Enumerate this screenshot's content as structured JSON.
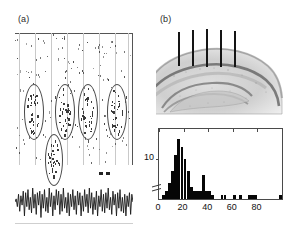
{
  "figure": {
    "background_color": "#ffffff"
  },
  "panel_a": {
    "label": "(a)",
    "name": "spike-raster-with-theta-trace",
    "description": "Raster of unit spikes across trials with grey vertical trial/position gridlines, five ellipse annotations marking clustered firing fields, a black scale marker, and a local-field-potential theta oscillation trace below.",
    "gridline_color": "#c9c9c9",
    "spike_color": "#3a3a3a",
    "ellipse_color": "#4a4a4a",
    "gridlines_x": [
      4,
      20,
      36,
      52,
      68,
      84,
      100,
      113
    ],
    "ellipses": [
      {
        "cx": 18,
        "cy": 78,
        "rx": 9,
        "ry": 27
      },
      {
        "cx": 49,
        "cy": 78,
        "rx": 9,
        "ry": 27
      },
      {
        "cx": 72,
        "cy": 78,
        "rx": 9,
        "ry": 27
      },
      {
        "cx": 101,
        "cy": 78,
        "rx": 9,
        "ry": 27
      },
      {
        "cx": 38,
        "cy": 126,
        "rx": 8,
        "ry": 25
      }
    ],
    "lfp_trace": {
      "name": "theta-oscillation",
      "color": "#1a1a1a",
      "points": [
        0,
        2,
        -3,
        5,
        -6,
        4,
        -2,
        7,
        -9,
        6,
        -3,
        8,
        -5,
        3,
        -7,
        9,
        -4,
        5,
        -8,
        6,
        -2,
        7,
        -10,
        5,
        -4,
        8,
        -6,
        3,
        -7,
        9,
        -3,
        6,
        -9,
        4,
        -5,
        8,
        -2,
        7,
        -8,
        5,
        -6,
        9,
        -4,
        3,
        -7,
        6,
        -9,
        5,
        -3,
        8,
        -5,
        4,
        -8,
        7,
        -2,
        6,
        -9,
        4,
        -6,
        8,
        -3,
        5,
        -7,
        9,
        -4,
        6,
        -8,
        3,
        -5,
        7,
        -9,
        4,
        -3,
        8,
        -6,
        5,
        -7,
        6,
        -4,
        9,
        -5,
        3,
        -8,
        7,
        -2,
        5,
        -9,
        6,
        -4,
        8,
        -6,
        3,
        -7,
        5,
        -9,
        4,
        -3,
        6,
        -8,
        5,
        0
      ]
    },
    "scale_marker": {
      "name": "scale-bar",
      "segments": 2
    }
  },
  "panel_b": {
    "label": "(b)",
    "name": "hippocampus-histology-section",
    "description": "Nissl-stained sagittal/coronal hippocampal section showing CA1 pyramidal layer, dentate gyrus and hilus, with five vertical tetrode/electrode tracks descending from the cortical surface.",
    "electrode_count": 5,
    "electrode_color": "#151515",
    "electrodes": [
      {
        "x": 22,
        "y": 4,
        "height": 34
      },
      {
        "x": 36,
        "y": 2,
        "height": 36
      },
      {
        "x": 50,
        "y": 1,
        "height": 38
      },
      {
        "x": 64,
        "y": 2,
        "height": 37
      },
      {
        "x": 78,
        "y": 3,
        "height": 36
      }
    ],
    "tissue_colors": {
      "background": "#ffffff",
      "light": "#e3e3e3",
      "mid": "#bdbdbd",
      "dark": "#8f8f8f",
      "cell_layer": "#6f6f6f"
    }
  },
  "panel_c": {
    "label": "(c)",
    "name": "firing-rate-histogram",
    "bar_color": "#060606",
    "axis_color": "#4a4a4a",
    "has_y_axis_break": true
  },
  "chart_data": {
    "type": "bar",
    "title": "",
    "subtitle": "",
    "xlabel": "",
    "ylabel": "",
    "legend": [],
    "grid": false,
    "legend_position": "none",
    "xlim": [
      0,
      100
    ],
    "ylim": [
      0,
      17
    ],
    "xticks": [
      0,
      20,
      40,
      60,
      80
    ],
    "xtick_labels": [
      "0",
      "20",
      "40",
      "60",
      "80"
    ],
    "yticks": [
      10
    ],
    "ytick_labels": [
      "10"
    ],
    "bin_width": 2.5,
    "categories": [
      "0",
      "2.5",
      "5",
      "7.5",
      "10",
      "12.5",
      "15",
      "17.5",
      "20",
      "22.5",
      "25",
      "27.5",
      "30",
      "32.5",
      "35",
      "37.5",
      "40",
      "42.5",
      "45",
      "47.5",
      "50",
      "52.5",
      "55",
      "57.5",
      "60",
      "62.5",
      "65",
      "67.5",
      "70",
      "72.5",
      "75",
      "77.5",
      "80",
      "82.5",
      "85",
      "87.5",
      "90",
      "92.5",
      "95",
      "97.5"
    ],
    "values": [
      0,
      1,
      2,
      4,
      7,
      11,
      15,
      13,
      10,
      7,
      3,
      2,
      2,
      2,
      6,
      2,
      2,
      1,
      0,
      0,
      1,
      1,
      0,
      0,
      1,
      0,
      1,
      0,
      0,
      1,
      1,
      1,
      0,
      0,
      0,
      0,
      0,
      0,
      0,
      1
    ],
    "annotations": [
      {
        "text": "(c)",
        "position": "top-left",
        "name": "panel-label"
      }
    ]
  }
}
